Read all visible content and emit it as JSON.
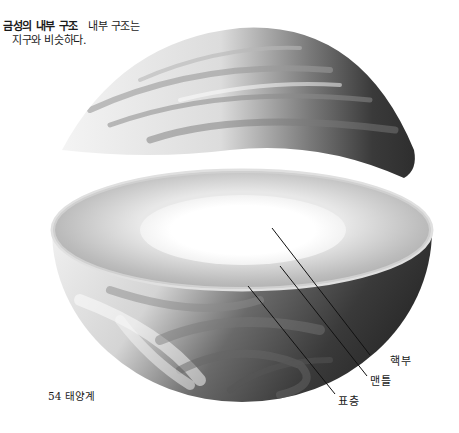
{
  "caption": {
    "title": "금성의 내부 구조",
    "text_line1": "내부 구조는",
    "text_line2": "지구와 비슷하다."
  },
  "figure": {
    "labels": [
      {
        "id": "core",
        "text": "핵부"
      },
      {
        "id": "mantle",
        "text": "맨틀"
      },
      {
        "id": "crust",
        "text": "표층"
      }
    ],
    "colors": {
      "surface_dark": "#3a3a3a",
      "surface_light": "#e6e6e6",
      "mantle": "#bdbdbd",
      "core": "#ffffff",
      "leader_line": "#111111"
    }
  },
  "footer": {
    "page_label": "54 태양계"
  }
}
